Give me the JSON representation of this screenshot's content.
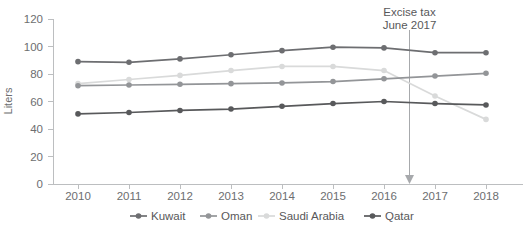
{
  "chart_data": {
    "type": "line",
    "title": "",
    "subtitle": "",
    "xlabel": "",
    "ylabel": "Liters",
    "x": [
      "2010",
      "2011",
      "2012",
      "2013",
      "2014",
      "2015",
      "2016",
      "2017",
      "2018"
    ],
    "categories": [
      "2010",
      "2011",
      "2012",
      "2013",
      "2014",
      "2015",
      "2016",
      "2017",
      "2018"
    ],
    "ylim": [
      0,
      120
    ],
    "yticks": [
      0,
      20,
      40,
      60,
      80,
      100,
      120
    ],
    "ytick_labels": [
      "0",
      "20",
      "40",
      "60",
      "80",
      "100",
      "120"
    ],
    "grid": false,
    "legend_position": "bottom",
    "series": [
      {
        "name": "Kuwait",
        "color": "#6d6e71",
        "values": [
          89,
          88.5,
          91,
          94,
          97,
          99.5,
          99,
          95.5,
          95.5
        ]
      },
      {
        "name": "Oman",
        "color": "#939598",
        "values": [
          71.5,
          72,
          72.5,
          73,
          73.5,
          74.5,
          76.5,
          78.5,
          80.5
        ]
      },
      {
        "name": "Saudi Arabia",
        "color": "#d9dada",
        "values": [
          73,
          76,
          79,
          82.5,
          85.5,
          85.5,
          82.5,
          64,
          47
        ]
      },
      {
        "name": "Qatar",
        "color": "#58595b",
        "values": [
          51,
          52,
          53.5,
          54.5,
          56.5,
          58.5,
          60,
          58.5,
          57.5
        ]
      }
    ],
    "annotations": [
      {
        "text_line1": "Excise tax",
        "text_line2": "June 2017",
        "x_value": 2016.5,
        "color": "#a7a9ac"
      }
    ]
  },
  "axis": {
    "y_label": "Liters",
    "y_ticks": [
      "120",
      "100",
      "80",
      "60",
      "40",
      "20",
      "0"
    ],
    "x_ticks": [
      "2010",
      "2011",
      "2012",
      "2013",
      "2014",
      "2015",
      "2016",
      "2017",
      "2018"
    ]
  },
  "legend": {
    "items": [
      {
        "label": "Kuwait",
        "color": "#6d6e71"
      },
      {
        "label": "Oman",
        "color": "#939598"
      },
      {
        "label": "Saudi Arabia",
        "color": "#d9dada"
      },
      {
        "label": "Qatar",
        "color": "#58595b"
      }
    ]
  },
  "annotation": {
    "line1": "Excise tax",
    "line2": "June 2017"
  }
}
